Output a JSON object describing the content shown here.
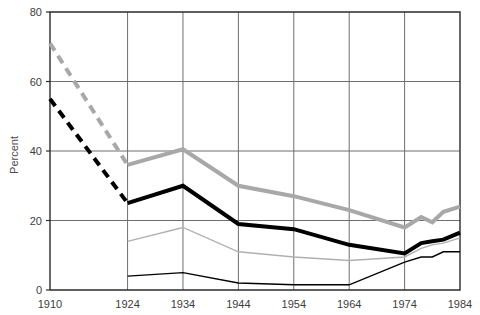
{
  "chart_data": {
    "type": "line",
    "title": "",
    "subtitle": "",
    "xlabel": "",
    "ylabel": "Percent",
    "x": [
      1910,
      1924,
      1934,
      1944,
      1954,
      1964,
      1974,
      1977,
      1979,
      1981,
      1984
    ],
    "xtick_labels": [
      "1910",
      "1924",
      "1934",
      "1944",
      "1954",
      "1964",
      "1974",
      "1984"
    ],
    "xtick_values": [
      1910,
      1924,
      1934,
      1944,
      1954,
      1964,
      1974,
      1984
    ],
    "ytick_labels": [
      "0",
      "20",
      "40",
      "60",
      "80"
    ],
    "ytick_values": [
      0,
      20,
      40,
      60,
      80
    ],
    "xlim": [
      1910,
      1984
    ],
    "ylim": [
      0,
      80
    ],
    "grid": "both",
    "legend_position": "none",
    "series": [
      {
        "name": "thick-gray-line",
        "color": "#a8a8a8",
        "width": 4,
        "style_early": "dashed",
        "style_late": "solid",
        "points": [
          {
            "x": 1910,
            "y": 71
          },
          {
            "x": 1924,
            "y": 36
          },
          {
            "x": 1934,
            "y": 40.5
          },
          {
            "x": 1944,
            "y": 30
          },
          {
            "x": 1954,
            "y": 27
          },
          {
            "x": 1964,
            "y": 23
          },
          {
            "x": 1974,
            "y": 18
          },
          {
            "x": 1977,
            "y": 21
          },
          {
            "x": 1979,
            "y": 19.5
          },
          {
            "x": 1981,
            "y": 22.5
          },
          {
            "x": 1984,
            "y": 24
          }
        ]
      },
      {
        "name": "thick-black-line",
        "color": "#000000",
        "width": 4,
        "style_early": "dashed",
        "style_late": "solid",
        "points": [
          {
            "x": 1910,
            "y": 55
          },
          {
            "x": 1924,
            "y": 25
          },
          {
            "x": 1934,
            "y": 30
          },
          {
            "x": 1944,
            "y": 19
          },
          {
            "x": 1954,
            "y": 17.5
          },
          {
            "x": 1964,
            "y": 13
          },
          {
            "x": 1974,
            "y": 10.5
          },
          {
            "x": 1977,
            "y": 13.5
          },
          {
            "x": 1979,
            "y": 14
          },
          {
            "x": 1981,
            "y": 14.5
          },
          {
            "x": 1984,
            "y": 16.5
          }
        ]
      },
      {
        "name": "thin-gray-line",
        "color": "#b0b0b0",
        "width": 1.4,
        "style_early": "solid",
        "style_late": "solid",
        "points": [
          {
            "x": 1924,
            "y": 14
          },
          {
            "x": 1934,
            "y": 18
          },
          {
            "x": 1944,
            "y": 11
          },
          {
            "x": 1954,
            "y": 9.5
          },
          {
            "x": 1964,
            "y": 8.5
          },
          {
            "x": 1974,
            "y": 9.5
          },
          {
            "x": 1977,
            "y": 12
          },
          {
            "x": 1979,
            "y": 13
          },
          {
            "x": 1981,
            "y": 13.5
          },
          {
            "x": 1984,
            "y": 15
          }
        ]
      },
      {
        "name": "thin-black-line",
        "color": "#000000",
        "width": 1.4,
        "style_early": "solid",
        "style_late": "solid",
        "points": [
          {
            "x": 1924,
            "y": 4
          },
          {
            "x": 1934,
            "y": 5
          },
          {
            "x": 1944,
            "y": 2
          },
          {
            "x": 1954,
            "y": 1.5
          },
          {
            "x": 1964,
            "y": 1.5
          },
          {
            "x": 1974,
            "y": 8
          },
          {
            "x": 1977,
            "y": 9.5
          },
          {
            "x": 1979,
            "y": 9.5
          },
          {
            "x": 1981,
            "y": 11
          },
          {
            "x": 1984,
            "y": 11
          }
        ]
      }
    ]
  },
  "colors": {
    "axis": "#2b2b2b",
    "grid": "#6e6e6e",
    "background": "#ffffff",
    "gray_series": "#a8a8a8",
    "black_series": "#000000",
    "tick_text": "#3d3d3d"
  },
  "layout": {
    "plot_left": 50,
    "plot_right": 460,
    "plot_top": 12,
    "plot_bottom": 290
  }
}
